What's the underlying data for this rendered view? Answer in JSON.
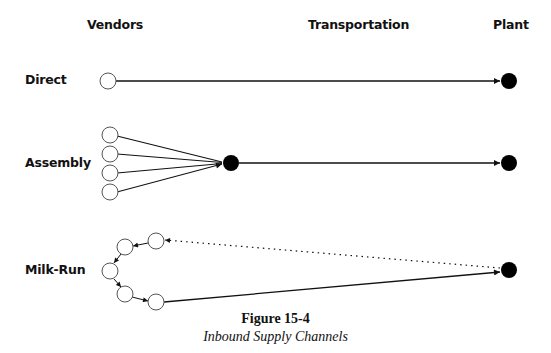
{
  "headers": {
    "vendors": "Vendors",
    "transportation": "Transportation",
    "plant": "Plant"
  },
  "rows": {
    "direct": "Direct",
    "assembly": "Assembly",
    "milk_run": "Milk-Run"
  },
  "caption": {
    "title": "Figure 15-4",
    "subtitle": "Inbound Supply Channels"
  },
  "legend": {
    "open_circle": "vendor",
    "filled_circle": "plant / consolidation point",
    "solid_line": "loaded transport",
    "dotted_line": "return trip"
  },
  "colors": {
    "ink": "#111111",
    "background": "#ffffff"
  },
  "channels": [
    {
      "name": "Direct",
      "vendor_count": 1,
      "intermediate": false,
      "return_dotted": false
    },
    {
      "name": "Assembly",
      "vendor_count": 4,
      "intermediate": true,
      "return_dotted": false
    },
    {
      "name": "Milk-Run",
      "vendor_count": 5,
      "intermediate": false,
      "return_dotted": true
    }
  ]
}
